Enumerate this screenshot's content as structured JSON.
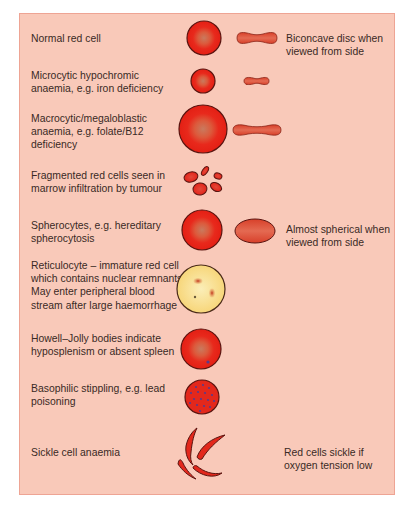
{
  "diagram": {
    "colors": {
      "panel_bg": "#f9c9b9",
      "panel_border": "#eea494",
      "cell_fill": "#e8291c",
      "cell_center": "#d7704f",
      "cell_outline": "#5a1410",
      "reticulocyte_fill": "#f9e29a",
      "stipple_dot": "#5a3a8a",
      "text": "#3a2a25"
    },
    "rows": [
      {
        "id": "normal",
        "label_lines": [
          "Normal red cell"
        ],
        "note_lines": [
          "Biconcave disc when",
          "viewed from side"
        ]
      },
      {
        "id": "microcytic",
        "label_lines": [
          "Microcytic hypochromic",
          "anaemia, e.g. iron deficiency"
        ]
      },
      {
        "id": "macrocytic",
        "label_lines": [
          "Macrocytic/megaloblastic",
          "anaemia, e.g. folate/B12",
          "deficiency"
        ]
      },
      {
        "id": "fragmented",
        "label_lines": [
          "Fragmented red cells seen in",
          "marrow infiltration by tumour"
        ]
      },
      {
        "id": "spherocytes",
        "label_lines": [
          "Spherocytes, e.g. hereditary",
          "spherocytosis"
        ],
        "note_lines": [
          "Almost spherical when",
          "viewed from side"
        ]
      },
      {
        "id": "reticulocyte",
        "label_lines": [
          "Reticulocyte – immature red cell",
          "which contains nuclear remnants,",
          "May enter peripheral blood",
          "stream after large haemorrhage"
        ]
      },
      {
        "id": "howell-jolly",
        "label_lines": [
          "Howell–Jolly bodies indicate",
          "hyposplenism or absent spleen"
        ]
      },
      {
        "id": "basophilic",
        "label_lines": [
          "Basophilic stippling, e.g. lead",
          "poisoning"
        ]
      },
      {
        "id": "sickle",
        "label_lines": [
          "Sickle cell anaemia"
        ],
        "note_lines": [
          "Red cells sickle if",
          "oxygen tension low"
        ]
      }
    ]
  }
}
